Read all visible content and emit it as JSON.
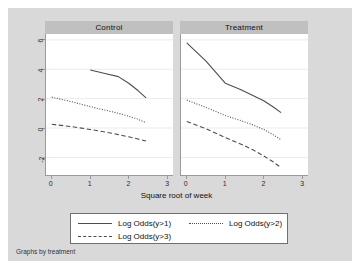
{
  "figure": {
    "note": "Graphs by treatment",
    "xtitle": "Square root of week",
    "bgcolor": "#d9d9d9",
    "plotcolor": "#ffffff",
    "headercolor": "#c0c0c0",
    "linecolor": "#4d4d4d",
    "gridcolor": "#ebebeb",
    "axiscolor": "#9a9a9a"
  },
  "panels": [
    {
      "title": "Control"
    },
    {
      "title": "Treatment"
    }
  ],
  "legend": {
    "entries": [
      {
        "label": "Log Odds(y>1)",
        "style": "solid"
      },
      {
        "label": "Log Odds(y>2)",
        "style": "dotted"
      },
      {
        "label": "Log Odds(y>3)",
        "style": "dashed"
      }
    ]
  },
  "axes": {
    "y": {
      "ticks": [
        6,
        4,
        2,
        0,
        -2
      ],
      "min": -3.2,
      "max": 6.4
    },
    "x": {
      "ticks": [
        0,
        1,
        2,
        3
      ],
      "min": -0.15,
      "max": 3.15
    }
  },
  "chart_data": {
    "type": "line",
    "title": "",
    "subtitle": "",
    "xlabel": "Square root of week",
    "ylabel": "",
    "xlim": [
      -0.15,
      3.15
    ],
    "ylim": [
      -3.2,
      6.4
    ],
    "xticks": [
      0,
      1,
      2,
      3
    ],
    "yticks": [
      6,
      4,
      2,
      0,
      -2
    ],
    "grid": true,
    "grid_axis": "y",
    "legend_position": "bottom",
    "note": "Graphs by treatment",
    "panels": [
      {
        "name": "Control",
        "series": [
          {
            "name": "Log Odds(y>1)",
            "style": "solid",
            "x": [
              1.0,
              1.41,
              1.73,
              2.0,
              2.24,
              2.45
            ],
            "y": [
              3.95,
              3.7,
              3.5,
              3.05,
              2.55,
              2.05
            ]
          },
          {
            "name": "Log Odds(y>2)",
            "style": "dotted",
            "x": [
              0.0,
              0.5,
              1.0,
              1.41,
              1.73,
              2.0,
              2.24,
              2.45
            ],
            "y": [
              2.1,
              1.8,
              1.45,
              1.2,
              1.0,
              0.8,
              0.6,
              0.35
            ]
          },
          {
            "name": "Log Odds(y>3)",
            "style": "dashed",
            "x": [
              0.0,
              0.5,
              1.0,
              1.41,
              1.73,
              2.0,
              2.24,
              2.45
            ],
            "y": [
              0.25,
              0.1,
              -0.1,
              -0.28,
              -0.45,
              -0.6,
              -0.75,
              -0.88
            ]
          }
        ]
      },
      {
        "name": "Treatment",
        "series": [
          {
            "name": "Log Odds(y>1)",
            "style": "solid",
            "x": [
              0.0,
              0.5,
              1.0,
              1.41,
              1.73,
              2.0,
              2.24,
              2.45
            ],
            "y": [
              5.8,
              4.55,
              3.05,
              2.6,
              2.2,
              1.85,
              1.45,
              1.05
            ]
          },
          {
            "name": "Log Odds(y>2)",
            "style": "dotted",
            "x": [
              0.0,
              0.5,
              1.0,
              1.41,
              1.73,
              2.0,
              2.24,
              2.45
            ],
            "y": [
              1.9,
              1.4,
              0.85,
              0.5,
              0.2,
              -0.1,
              -0.45,
              -0.8
            ]
          },
          {
            "name": "Log Odds(y>3)",
            "style": "dashed",
            "x": [
              0.0,
              0.5,
              1.0,
              1.41,
              1.73,
              2.0,
              2.24,
              2.45
            ],
            "y": [
              0.45,
              -0.05,
              -0.65,
              -1.1,
              -1.5,
              -1.9,
              -2.3,
              -2.7
            ]
          }
        ]
      }
    ]
  }
}
